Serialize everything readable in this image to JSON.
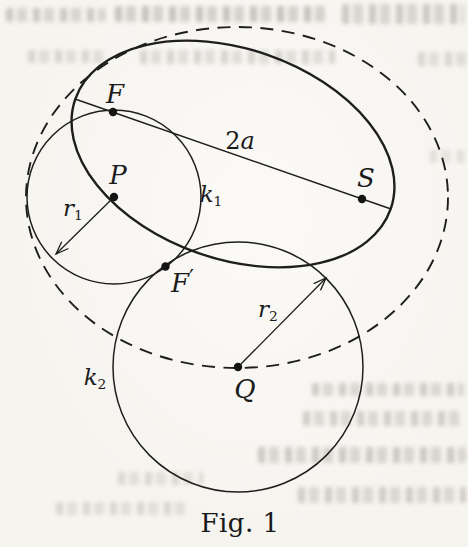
{
  "figure": {
    "caption": "Fig. 1",
    "caption_pos": {
      "cx": 240,
      "cy": 523
    },
    "ink_color": "#1e1e1e",
    "paper_color": "#f6f4ef"
  },
  "geometry": {
    "canvas": {
      "width": 468,
      "height": 547
    },
    "solid_ellipse": {
      "cx": 233,
      "cy": 154,
      "rx": 167,
      "ry": 105,
      "rotation_deg": 19.2,
      "stroke_width": 2.4,
      "note": "ellipse with foci F and S, major axis 2a"
    },
    "dashed_ellipse": {
      "cx": 237,
      "cy": 197.5,
      "rx": 211,
      "ry": 170.5,
      "rotation_deg": 0,
      "stroke_width": 1.9,
      "dash": "13 8.5"
    },
    "circle_k1": {
      "cx": 114,
      "cy": 197,
      "r": 87,
      "stroke_width": 1.5,
      "center_label": "P",
      "radius_label": "r1"
    },
    "circle_k2": {
      "cx": 238,
      "cy": 367,
      "r": 125,
      "stroke_width": 1.5,
      "center_label": "Q",
      "radius_label": "r2"
    },
    "major_axis_line": {
      "x1": 75,
      "y1": 99,
      "x2": 391,
      "y2": 209,
      "stroke_width": 1.4,
      "label": "2a"
    },
    "radius_arrows": [
      {
        "name": "r1-radius-arrow",
        "x1": 114,
        "y1": 197,
        "x2": 56,
        "y2": 254
      },
      {
        "name": "r2-radius-arrow",
        "x1": 238,
        "y1": 367,
        "x2": 326,
        "y2": 278
      }
    ],
    "points": [
      {
        "name": "point-F",
        "x": 113,
        "y": 112
      },
      {
        "name": "point-P",
        "x": 114,
        "y": 197
      },
      {
        "name": "point-F-prime",
        "x": 165.5,
        "y": 266.5
      },
      {
        "name": "point-S",
        "x": 362,
        "y": 199
      },
      {
        "name": "point-Q",
        "x": 238,
        "y": 367
      }
    ],
    "dot_radius": 4.2
  },
  "labels": [
    {
      "name": "label-F",
      "cx": 115,
      "cy": 94,
      "size": 26,
      "parts": [
        {
          "text": "F",
          "style": "it"
        }
      ]
    },
    {
      "name": "label-P",
      "cx": 118,
      "cy": 175,
      "size": 26,
      "parts": [
        {
          "text": "P",
          "style": "it"
        }
      ]
    },
    {
      "name": "label-S",
      "cx": 366,
      "cy": 178,
      "size": 26,
      "parts": [
        {
          "text": "S",
          "style": "it"
        }
      ]
    },
    {
      "name": "label-F-prime",
      "cx": 182,
      "cy": 281,
      "size": 26,
      "parts": [
        {
          "text": "F",
          "style": "it"
        },
        {
          "text": "′",
          "style": "pr"
        }
      ]
    },
    {
      "name": "label-Q",
      "cx": 245,
      "cy": 389,
      "size": 26,
      "parts": [
        {
          "text": "Q",
          "style": "it"
        }
      ]
    },
    {
      "name": "label-2a",
      "cx": 240,
      "cy": 141,
      "size": 24,
      "parts": [
        {
          "text": "2",
          "style": "up"
        },
        {
          "text": "a",
          "style": "it"
        }
      ]
    },
    {
      "name": "label-k1",
      "cx": 211,
      "cy": 196,
      "size": 23,
      "parts": [
        {
          "text": "k",
          "style": "it"
        },
        {
          "text": "1",
          "style": "sb"
        }
      ]
    },
    {
      "name": "label-k2",
      "cx": 95,
      "cy": 379,
      "size": 23,
      "parts": [
        {
          "text": "k",
          "style": "it"
        },
        {
          "text": "2",
          "style": "sb"
        }
      ]
    },
    {
      "name": "label-r1",
      "cx": 73,
      "cy": 210,
      "size": 23,
      "parts": [
        {
          "text": "r",
          "style": "it"
        },
        {
          "text": "1",
          "style": "sb"
        }
      ]
    },
    {
      "name": "label-r2",
      "cx": 268,
      "cy": 311,
      "size": 23,
      "parts": [
        {
          "text": "r",
          "style": "it"
        },
        {
          "text": "2",
          "style": "sb"
        }
      ]
    }
  ],
  "bleed_marks": [
    {
      "x": 6,
      "y": 8,
      "w": 100,
      "h": 14,
      "o": 0.42
    },
    {
      "x": 115,
      "y": 6,
      "w": 215,
      "h": 16,
      "o": 0.48
    },
    {
      "x": 342,
      "y": 4,
      "w": 122,
      "h": 20,
      "o": 0.42
    },
    {
      "x": 28,
      "y": 50,
      "w": 75,
      "h": 13,
      "o": 0.3
    },
    {
      "x": 140,
      "y": 50,
      "w": 195,
      "h": 14,
      "o": 0.32
    },
    {
      "x": 418,
      "y": 52,
      "w": 48,
      "h": 14,
      "o": 0.3
    },
    {
      "x": 430,
      "y": 150,
      "w": 38,
      "h": 13,
      "o": 0.22
    },
    {
      "x": 312,
      "y": 383,
      "w": 152,
      "h": 13,
      "o": 0.4
    },
    {
      "x": 303,
      "y": 411,
      "w": 162,
      "h": 15,
      "o": 0.38
    },
    {
      "x": 258,
      "y": 447,
      "w": 208,
      "h": 16,
      "o": 0.42
    },
    {
      "x": 298,
      "y": 487,
      "w": 168,
      "h": 16,
      "o": 0.38
    },
    {
      "x": 118,
      "y": 472,
      "w": 85,
      "h": 13,
      "o": 0.28
    },
    {
      "x": 56,
      "y": 502,
      "w": 130,
      "h": 13,
      "o": 0.28
    }
  ]
}
